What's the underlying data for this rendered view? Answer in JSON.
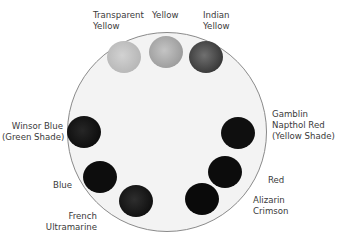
{
  "palette": {
    "swatches": [
      {
        "name": "Transparent Yellow",
        "label": "Transparent\nYellow",
        "color": "#c9c9c9"
      },
      {
        "name": "Yellow",
        "label": "Yellow",
        "color": "#b3b3b3"
      },
      {
        "name": "Indian Yellow",
        "label": "Indian\nYellow",
        "color": "#4a4a4a"
      },
      {
        "name": "Winsor Blue (Green Shade)",
        "label": "Winsor Blue\n(Green Shade)",
        "color": "#141414"
      },
      {
        "name": "Blue",
        "label": "Blue",
        "color": "#0d0d0d"
      },
      {
        "name": "French Ultramarine",
        "label": "French\nUltramarine",
        "color": "#1c1c1c"
      },
      {
        "name": "Gamblin Napthol Red (Yellow Shade)",
        "label": "Gamblin\nNapthol Red\n(Yellow Shade)",
        "color": "#0f0f0f"
      },
      {
        "name": "Red",
        "label": "Red",
        "color": "#0c0c0c"
      },
      {
        "name": "Alizarin Crimson",
        "label": "Alizarin\nCrimson",
        "color": "#0a0a0a"
      }
    ]
  }
}
